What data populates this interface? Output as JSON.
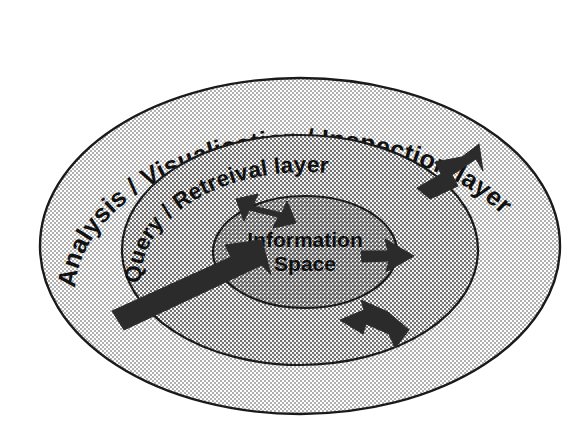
{
  "diagram": {
    "background_color": "#ffffff",
    "outline_color": "#1a1a1a",
    "arrow_color": "#2b2b2b",
    "layers": [
      {
        "id": "outer",
        "name": "analysis-visualisation-inspection-layer",
        "label": "Analysis / Visualisation / Inspection layer",
        "fill_color": "#d9d9d9",
        "ellipse": {
          "cx": 300,
          "cy": 246,
          "rx": 260,
          "ry": 168
        }
      },
      {
        "id": "middle",
        "name": "query-retrieval-layer",
        "label": "Query / Retreival layer",
        "fill_color": "#c9c9c9",
        "ellipse": {
          "cx": 300,
          "cy": 250,
          "rx": 178,
          "ry": 115
        }
      },
      {
        "id": "inner",
        "name": "information-space",
        "label": "Information",
        "label_line2": "Space",
        "fill_color": "#bdbdbd",
        "ellipse": {
          "cx": 305,
          "cy": 252,
          "rx": 92,
          "ry": 56
        }
      }
    ],
    "arrows": [
      {
        "id": "arrow-top-inward",
        "label": "inbound arrow into information space from upper left",
        "direction": "down-right"
      },
      {
        "id": "arrow-upper-right-outward",
        "label": "outbound arrow from query layer to analysis layer",
        "direction": "up-right"
      },
      {
        "id": "arrow-right-outward",
        "label": "outbound arrow from information space to the right",
        "direction": "right"
      },
      {
        "id": "arrow-lower-right-inward",
        "label": "inbound arrow from analysis layer toward centre",
        "direction": "up-left"
      },
      {
        "id": "arrow-left-long-inward",
        "label": "long inbound arrow from outer layer into information space",
        "direction": "up-right"
      }
    ]
  }
}
